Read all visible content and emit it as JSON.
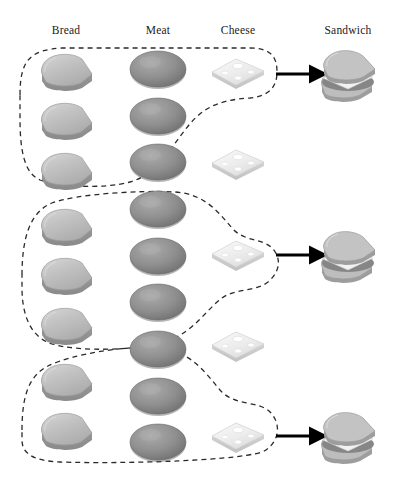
{
  "diagram": {
    "background_color": "#ffffff",
    "columns": [
      {
        "id": "bread",
        "label": "Bread",
        "x": 66,
        "count": 8
      },
      {
        "id": "meat",
        "label": "Meat",
        "x": 158,
        "count": 9
      },
      {
        "id": "cheese",
        "label": "Cheese",
        "x": 238,
        "count": 5
      },
      {
        "id": "sandwich",
        "label": "Sandwich",
        "x": 348,
        "count": 3
      }
    ],
    "colors": {
      "bread_fill": "#b9b9b9",
      "bread_light": "#d2d2d2",
      "bread_edge": "#8e8e8e",
      "meat_fill": "#8d8d8d",
      "meat_light": "#a8a8a8",
      "meat_edge": "#6f6f6f",
      "cheese_fill": "#ececec",
      "cheese_light": "#f8f8f8",
      "cheese_edge": "#c9c9c9",
      "outline": "#2a2a2a",
      "arrow": "#000000",
      "text": "#1a1a1a"
    },
    "stroke": {
      "dash_pattern": "5,4",
      "dash_width": 1.3,
      "arrow_width": 3.2
    },
    "bread_items": [
      {
        "index": 1,
        "x": 66,
        "y": 73,
        "grouped": true,
        "group": 1
      },
      {
        "index": 2,
        "x": 66,
        "y": 122,
        "grouped": true,
        "group": 1
      },
      {
        "index": 3,
        "x": 66,
        "y": 172,
        "grouped": false,
        "group": null
      },
      {
        "index": 4,
        "x": 66,
        "y": 228,
        "grouped": true,
        "group": 2
      },
      {
        "index": 5,
        "x": 66,
        "y": 277,
        "grouped": true,
        "group": 2
      },
      {
        "index": 6,
        "x": 66,
        "y": 327,
        "grouped": false,
        "group": null
      },
      {
        "index": 7,
        "x": 66,
        "y": 383,
        "grouped": true,
        "group": 3
      },
      {
        "index": 8,
        "x": 66,
        "y": 432,
        "grouped": true,
        "group": 3
      }
    ],
    "meat_items": [
      {
        "index": 1,
        "x": 158,
        "y": 70,
        "grouped": true,
        "group": 1
      },
      {
        "index": 2,
        "x": 158,
        "y": 117,
        "grouped": true,
        "group": 1
      },
      {
        "index": 3,
        "x": 158,
        "y": 163,
        "grouped": true,
        "group": 1
      },
      {
        "index": 4,
        "x": 158,
        "y": 210,
        "grouped": true,
        "group": 2
      },
      {
        "index": 5,
        "x": 158,
        "y": 257,
        "grouped": true,
        "group": 2
      },
      {
        "index": 6,
        "x": 158,
        "y": 303,
        "grouped": true,
        "group": 2
      },
      {
        "index": 7,
        "x": 158,
        "y": 350,
        "grouped": true,
        "group": 3
      },
      {
        "index": 8,
        "x": 158,
        "y": 397,
        "grouped": true,
        "group": 3
      },
      {
        "index": 9,
        "x": 158,
        "y": 443,
        "grouped": true,
        "group": 3
      }
    ],
    "cheese_items": [
      {
        "index": 1,
        "x": 238,
        "y": 72,
        "grouped": true,
        "group": 1
      },
      {
        "index": 2,
        "x": 238,
        "y": 163,
        "grouped": false,
        "group": null
      },
      {
        "index": 3,
        "x": 238,
        "y": 254,
        "grouped": true,
        "group": 2
      },
      {
        "index": 4,
        "x": 238,
        "y": 345,
        "grouped": true,
        "group": null
      },
      {
        "index": 5,
        "x": 238,
        "y": 436,
        "grouped": true,
        "group": 3
      }
    ],
    "sandwich_items": [
      {
        "index": 1,
        "x": 348,
        "y": 75
      },
      {
        "index": 2,
        "x": 348,
        "y": 256
      },
      {
        "index": 3,
        "x": 348,
        "y": 437
      }
    ],
    "arrows": [
      {
        "index": 1,
        "x1": 276,
        "y1": 74,
        "x2": 312,
        "y2": 74
      },
      {
        "index": 2,
        "x1": 276,
        "y1": 255,
        "x2": 312,
        "y2": 255
      },
      {
        "index": 3,
        "x1": 276,
        "y1": 436,
        "x2": 312,
        "y2": 436
      }
    ],
    "groups": [
      {
        "index": 1,
        "label": "sandwich-group-1",
        "contains": {
          "bread": 2,
          "meat": 3,
          "cheese": 1
        },
        "path": "M 20 95 C 20 60, 30 50, 62 48 L 250 48 C 272 48, 277 58, 277 72 C 277 88, 268 96, 250 98 C 215 100, 200 110, 185 130 C 168 152, 155 175, 130 182 C 105 189, 60 187, 40 180 C 24 173, 20 150, 20 118 Z"
      },
      {
        "index": 2,
        "label": "sandwich-group-2",
        "contains": {
          "bread": 2,
          "meat": 3,
          "cheese": 1
        },
        "path": "M 22 275 C 22 238, 30 212, 52 203 C 76 194, 140 190, 175 192 C 205 194, 218 212, 232 228 C 244 242, 262 238, 272 248 C 282 258, 280 272, 268 282 C 255 292, 236 288, 222 298 C 206 310, 195 330, 170 340 C 142 351, 78 352, 52 344 C 30 337, 22 314, 22 288 Z"
      },
      {
        "index": 3,
        "label": "sandwich-group-3",
        "contains": {
          "bread": 2,
          "meat": 3,
          "cheese": 1
        },
        "path": "M 22 430 C 22 398, 28 376, 48 366 C 72 354, 128 345, 160 348 C 190 351, 205 372, 220 390 C 235 407, 258 400, 270 412 C 281 423, 280 440, 266 450 C 250 461, 120 464, 60 462 C 34 461, 22 454, 22 440 Z"
      }
    ],
    "ungrouped_note": {
      "leftover_bread": 2,
      "leftover_cheese": 2
    }
  }
}
